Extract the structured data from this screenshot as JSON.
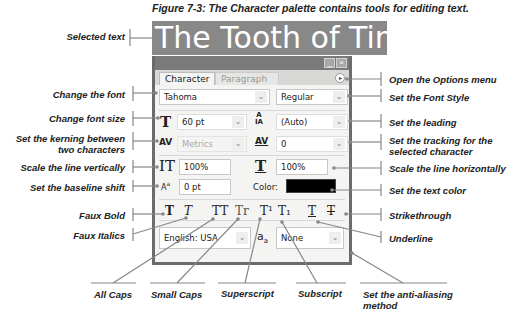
{
  "caption": "Figure 7-3: The Character palette contains tools for editing text.",
  "selected_text": "The Tooth of Time",
  "palette": {
    "tabs": [
      {
        "label": "Character",
        "active": true
      },
      {
        "label": "Paragraph",
        "active": false
      }
    ],
    "window_buttons": {
      "minimize": "_",
      "close": "×"
    },
    "options_button": "▸",
    "font_family": "Tahoma",
    "font_style": "Regular",
    "font_size": "60 pt",
    "leading": "(Auto)",
    "kerning": "Metrics",
    "tracking": "0",
    "vertical_scale": "100%",
    "horizontal_scale": "100%",
    "baseline_shift": "0 pt",
    "color_label": "Color:",
    "color_value": "#000000",
    "language": "English: USA",
    "anti_aliasing": "None",
    "style_buttons": {
      "faux_bold": "T",
      "faux_italic": "T",
      "all_caps": "TT",
      "small_caps": "Tr",
      "superscript": "T¹",
      "subscript": "T₁",
      "underline": "T",
      "strikethrough": "T"
    },
    "icons": {
      "font_size": "T",
      "leading": "A/A",
      "kerning": "AV",
      "tracking": "AV",
      "vertical_scale": "IT",
      "horizontal_scale": "T",
      "baseline_shift": "Aa",
      "anti_aliasing": "aa"
    }
  },
  "callouts": {
    "left": [
      "Selected text",
      "Change the font",
      "Change font size",
      "Set the kerning between\ntwo characters",
      "Scale the line vertically",
      "Set the baseline shift",
      "Faux Bold",
      "Faux Italics"
    ],
    "right": [
      "Open the Options menu",
      "Set the Font Style",
      "Set the leading",
      "Set the tracking for the\nselected character",
      "Scale the line horizontally",
      "Set the text color",
      "Strikethrough",
      "Underline"
    ],
    "bottom": [
      "All Caps",
      "Small Caps",
      "Superscript",
      "Subscript",
      "Set the anti-aliasing\nmethod"
    ]
  }
}
